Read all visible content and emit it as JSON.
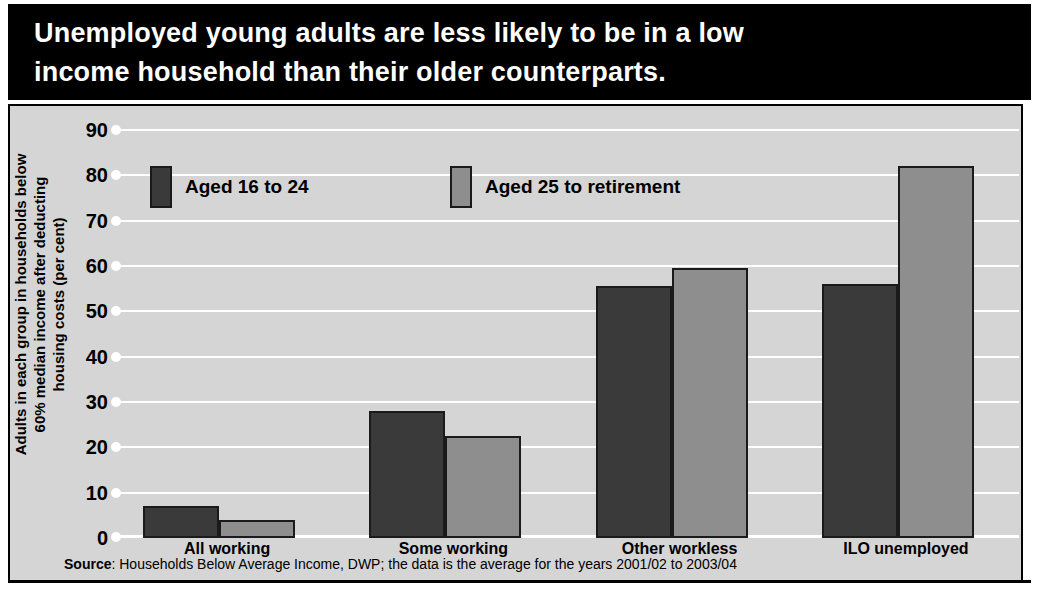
{
  "title": {
    "line1": "Unemployed young adults are less likely to be in a low",
    "line2": "income household than their older counterparts."
  },
  "axis": {
    "ylabel_line1": "Adults in each group in households below",
    "ylabel_line2": "60% median income after deducting",
    "ylabel_line3": "housing costs (per cent)"
  },
  "source": {
    "prefix": "Source",
    "text": ": Households Below Average Income, DWP; the data is the average for the years 2001/02 to 2003/04"
  },
  "colors": {
    "young": "#3a3a3a",
    "older": "#8e8e8e",
    "panel": "#d5d5d5",
    "banner": "#000000",
    "gridline": "#ffffff"
  },
  "chart_data": {
    "type": "bar",
    "title": "Unemployed young adults are less likely to be in a low income household than their older counterparts.",
    "xlabel": "",
    "ylabel": "Adults in each group in households below 60% median income after deducting housing costs (per cent)",
    "categories": [
      "All working",
      "Some working",
      "Other workless",
      "ILO unemployed"
    ],
    "series": [
      {
        "name": "Aged 16 to 24",
        "values": [
          7,
          28,
          55.5,
          56
        ]
      },
      {
        "name": "Aged 25 to retirement",
        "values": [
          4,
          22.5,
          59.5,
          82
        ]
      }
    ],
    "ylim": [
      0,
      90
    ],
    "yticks": [
      0,
      10,
      20,
      30,
      40,
      50,
      60,
      70,
      80,
      90
    ],
    "ytick_labels": [
      "0",
      "10",
      "20",
      "30",
      "40",
      "50",
      "60",
      "70",
      "80",
      "90"
    ],
    "grid": true,
    "legend_position": "upper-left-inside",
    "source": "Source: Households Below Average Income, DWP; the data is the average for the years 2001/02 to 2003/04"
  }
}
